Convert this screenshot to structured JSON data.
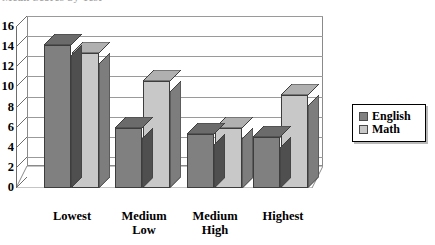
{
  "chart_data": {
    "type": "bar",
    "title": "Mean Scores by Test",
    "xlabel": "",
    "ylabel": "",
    "categories": [
      "Lowest",
      "Medium Low",
      "Medium High",
      "Highest"
    ],
    "series": [
      {
        "name": "English",
        "color": "#808080",
        "values": [
          14.2,
          6.0,
          5.4,
          5.1
        ]
      },
      {
        "name": "Math",
        "color": "#c8c8c8",
        "values": [
          13.4,
          10.6,
          6.0,
          9.2
        ]
      }
    ],
    "ylim": [
      0,
      16
    ],
    "yticks": [
      0,
      2,
      4,
      6,
      8,
      10,
      12,
      14,
      16
    ],
    "ytick_labels": [
      "0",
      "2",
      "4",
      "6",
      "8",
      "10",
      "12",
      "14",
      "16"
    ],
    "grid": true,
    "legend_position": "right",
    "style": "3d-column"
  },
  "legend": {
    "items": [
      {
        "label": "English",
        "color": "#808080"
      },
      {
        "label": "Math",
        "color": "#c8c8c8"
      }
    ]
  },
  "colors": {
    "english_face": "#808080",
    "english_side": "#4f4f4f",
    "english_top": "#6b6b6b",
    "math_face": "#c8c8c8",
    "math_side": "#7d7d7d",
    "math_top": "#b0b0b0",
    "gridline": "#9a9a9a",
    "axis": "#6d6d6d",
    "floor": "#b5b5b5"
  }
}
